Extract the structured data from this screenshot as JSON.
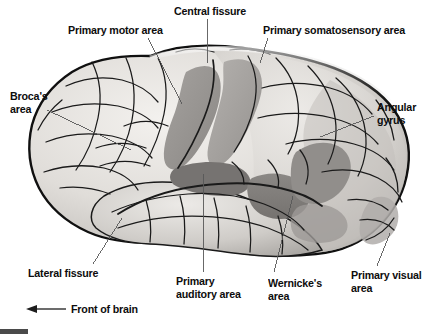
{
  "figure": {
    "view": "lateral",
    "style": "grayscale anatomical line drawing",
    "orientation_note": "Front of brain",
    "colors": {
      "background": "#ffffff",
      "outline": "#101010",
      "cortex_light": "#ebe9e6",
      "cortex_mid": "#c9c6c2",
      "cortex_shadow": "#a9a6a2",
      "highlight_area": "#8e8b88",
      "highlight_area_dark": "#6f6d6b",
      "sulci_line": "#1a1a1a",
      "leader_line": "#585858",
      "text": "#0d0d0d",
      "corner_bar": "#4a4a4a"
    }
  },
  "labels": [
    {
      "id": "primary-motor-area",
      "text": "Primary motor area",
      "lines": [
        "Primary motor area"
      ],
      "x": 68,
      "y": 24,
      "align": "left"
    },
    {
      "id": "central-fissure",
      "text": "Central fissure",
      "lines": [
        "Central fissure"
      ],
      "x": 174,
      "y": 5,
      "align": "left"
    },
    {
      "id": "primary-somatosensory-area",
      "text": "Primary somatosensory area",
      "lines": [
        "Primary somatosensory area"
      ],
      "x": 263,
      "y": 24,
      "align": "left"
    },
    {
      "id": "brocas-area",
      "text": "Broca's area",
      "lines": [
        "Broca's",
        "area"
      ],
      "x": 10,
      "y": 90,
      "align": "left"
    },
    {
      "id": "angular-gyrus",
      "text": "Angular gyrus",
      "lines": [
        "Angular",
        "gyrus"
      ],
      "x": 377,
      "y": 101,
      "align": "left"
    },
    {
      "id": "lateral-fissure",
      "text": "Lateral fissure",
      "lines": [
        "Lateral fissure"
      ],
      "x": 28,
      "y": 267,
      "align": "left"
    },
    {
      "id": "primary-auditory-area",
      "text": "Primary auditory area",
      "lines": [
        "Primary",
        "auditory area"
      ],
      "x": 176,
      "y": 275,
      "align": "left"
    },
    {
      "id": "wernickes-area",
      "text": "Wernicke's area",
      "lines": [
        "Wernicke's",
        "area"
      ],
      "x": 268,
      "y": 277,
      "align": "left"
    },
    {
      "id": "primary-visual-area",
      "text": "Primary visual area",
      "lines": [
        "Primary visual",
        "area"
      ],
      "x": 351,
      "y": 269,
      "align": "left"
    }
  ],
  "direction_marker": {
    "id": "front-of-brain",
    "text": "Front of brain",
    "x": 71,
    "y": 303,
    "arrow_from_x": 66,
    "arrow_to_x": 31,
    "arrow_y": 309,
    "points": "left"
  },
  "leader_lines": [
    {
      "for": "primary-motor-area",
      "x1": 148,
      "y1": 38,
      "x2": 182,
      "y2": 104
    },
    {
      "for": "central-fissure",
      "x1": 207,
      "y1": 19,
      "x2": 207,
      "y2": 63
    },
    {
      "for": "primary-somatosensory-area",
      "x1": 268,
      "y1": 38,
      "x2": 260,
      "y2": 63
    },
    {
      "for": "brocas-area",
      "x1": 47,
      "y1": 110,
      "x2": 131,
      "y2": 150
    },
    {
      "for": "angular-gyrus",
      "x1": 374,
      "y1": 116,
      "x2": 320,
      "y2": 137
    },
    {
      "for": "lateral-fissure",
      "x1": 93,
      "y1": 264,
      "x2": 122,
      "y2": 218
    },
    {
      "for": "primary-auditory-area",
      "x1": 203,
      "y1": 272,
      "x2": 203,
      "y2": 174
    },
    {
      "for": "wernickes-area",
      "x1": 274,
      "y1": 272,
      "x2": 293,
      "y2": 196
    },
    {
      "for": "primary-visual-area",
      "x1": 377,
      "y1": 266,
      "x2": 390,
      "y2": 233
    }
  ]
}
